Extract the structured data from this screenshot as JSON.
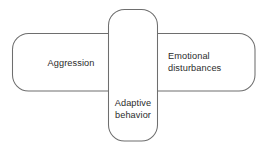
{
  "diagram": {
    "type": "venn-diagram",
    "background_color": "#ffffff",
    "stroke_color": "#6e6e6e",
    "text_color": "#2b2b2b",
    "overlap_fill_color": "#c9c9c9",
    "shape_fill_color": "#ffffff",
    "sets": [
      {
        "id": "aggression",
        "label": "Aggression",
        "label_lines": [
          "Aggression"
        ],
        "orientation": "horizontal",
        "position": "left"
      },
      {
        "id": "emotional-disturbances",
        "label": "Emotional disturbances",
        "label_lines": [
          "Emotional",
          "disturbances"
        ],
        "orientation": "horizontal",
        "position": "right"
      },
      {
        "id": "adaptive-behavior",
        "label": "Adaptive behavior",
        "label_lines": [
          "Adaptive",
          "behavior"
        ],
        "orientation": "vertical",
        "position": "center"
      }
    ],
    "overlap_region": {
      "id": "central-overlap",
      "label": "",
      "fill": "#c9c9c9",
      "members": [
        "aggression",
        "emotional-disturbances",
        "adaptive-behavior"
      ]
    }
  }
}
